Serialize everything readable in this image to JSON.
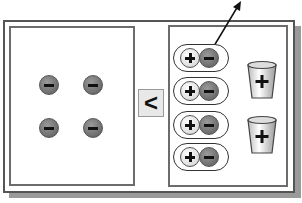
{
  "diagram": {
    "left_panel": {
      "label": "",
      "ions": [
        {
          "type": "negative",
          "symbol": "−"
        },
        {
          "type": "negative",
          "symbol": "−"
        },
        {
          "type": "negative",
          "symbol": "−"
        },
        {
          "type": "negative",
          "symbol": "−"
        }
      ]
    },
    "comparison": {
      "symbol": "<"
    },
    "right_panel": {
      "ion_pairs": [
        {
          "positive": "+",
          "negative": "−"
        },
        {
          "positive": "+",
          "negative": "−"
        },
        {
          "positive": "+",
          "negative": "−"
        },
        {
          "positive": "+",
          "negative": "−"
        }
      ],
      "bins": [
        {
          "symbol": "+"
        },
        {
          "symbol": "+"
        }
      ],
      "arrow": "up-right"
    },
    "colors": {
      "negative_ion": "#707070",
      "positive_ion": "#e8e8e8",
      "frame": "#555555",
      "panel_border": "#6c6c6c"
    }
  }
}
